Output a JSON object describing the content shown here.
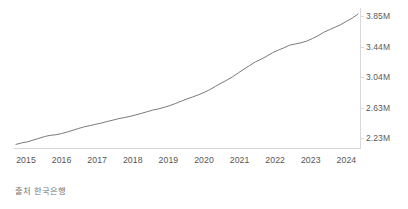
{
  "source_note": "출처 한국은행",
  "axis": {
    "y_ticks": [
      {
        "label": "3.85M",
        "value": 3850000
      },
      {
        "label": "3.44M",
        "value": 3440000
      },
      {
        "label": "3.04M",
        "value": 3040000
      },
      {
        "label": "2.63M",
        "value": 2630000
      },
      {
        "label": "2.23M",
        "value": 2230000
      }
    ],
    "x_ticks": [
      "2015",
      "2016",
      "2017",
      "2018",
      "2019",
      "2020",
      "2021",
      "2022",
      "2023",
      "2024"
    ]
  },
  "colors": {
    "line": "#6b6b6b",
    "axis": "#d8d8d8",
    "tick_text": "#555555",
    "y_tick_text": "#5a5a5a",
    "source_text": "#767676",
    "background": "#ffffff"
  },
  "chart_data": {
    "type": "line",
    "title": "",
    "subtitle": "",
    "xlabel": "",
    "ylabel": "",
    "grid": false,
    "legend": "none",
    "xlim": [
      "2014-10",
      "2024-10"
    ],
    "ylim": [
      2100000,
      3960000
    ],
    "ytick_values": [
      2230000,
      2630000,
      3040000,
      3440000,
      3850000
    ],
    "xtick_labels": [
      "2015",
      "2016",
      "2017",
      "2018",
      "2019",
      "2020",
      "2021",
      "2022",
      "2023",
      "2024"
    ],
    "annotations": [],
    "series": [
      {
        "name": "한국은행 시계열",
        "x": [
          "2014-10",
          "2014-12",
          "2015-02",
          "2015-04",
          "2015-06",
          "2015-08",
          "2015-10",
          "2015-12",
          "2016-02",
          "2016-04",
          "2016-06",
          "2016-08",
          "2016-10",
          "2016-12",
          "2017-02",
          "2017-04",
          "2017-06",
          "2017-08",
          "2017-10",
          "2017-12",
          "2018-02",
          "2018-04",
          "2018-06",
          "2018-08",
          "2018-10",
          "2018-12",
          "2019-02",
          "2019-04",
          "2019-06",
          "2019-08",
          "2019-10",
          "2019-12",
          "2020-02",
          "2020-04",
          "2020-06",
          "2020-08",
          "2020-10",
          "2020-12",
          "2021-02",
          "2021-04",
          "2021-06",
          "2021-08",
          "2021-10",
          "2021-12",
          "2022-02",
          "2022-04",
          "2022-06",
          "2022-08",
          "2022-10",
          "2022-12",
          "2023-02",
          "2023-04",
          "2023-06",
          "2023-08",
          "2023-10",
          "2023-12",
          "2024-02",
          "2024-04",
          "2024-06",
          "2024-08",
          "2024-10"
        ],
        "values": [
          2148000,
          2168000,
          2182000,
          2205000,
          2228000,
          2252000,
          2268000,
          2276000,
          2292000,
          2312000,
          2336000,
          2360000,
          2382000,
          2398000,
          2416000,
          2432000,
          2452000,
          2470000,
          2490000,
          2504000,
          2520000,
          2540000,
          2560000,
          2582000,
          2604000,
          2620000,
          2640000,
          2664000,
          2692000,
          2722000,
          2752000,
          2778000,
          2806000,
          2838000,
          2876000,
          2920000,
          2962000,
          3002000,
          3046000,
          3098000,
          3148000,
          3196000,
          3244000,
          3280000,
          3320000,
          3366000,
          3400000,
          3430000,
          3466000,
          3482000,
          3498000,
          3520000,
          3554000,
          3592000,
          3638000,
          3672000,
          3706000,
          3740000,
          3784000,
          3826000,
          3880000
        ]
      }
    ]
  },
  "line_path": "M 7,133.5 L 12,130.0 L 16,128.0 L 22,124.5 L 28,120.5 L 34,116.5 L 39,113.5 L 43,112.0 L 48,109.5 L 54,106.0 L 60,102.0 L 66,98.0 L 72,94.5 L 77,92.0 L 82,89.0 L 87,86.5 L 93,83.5 L 98,80.5 L 104,77.5 L 109,75.0 L 114,72.5 L 120,69.5 L 126,66.5 L 132,63.0 L 139,59.5 L 144,57.0 L 150,54.0 L 156,50.5 L 163,46.5 L 170,42.0 L 177,37.5 L 183,33.5 L 190,29.5 L 197,25.0 L 205,19.5 L 213,13.5 L 221,7.5 L 228,2.0 L 236,-4.0 L 244,-11.5",
  "interaction": {
    "hover_tooltip_enabled": true
  }
}
